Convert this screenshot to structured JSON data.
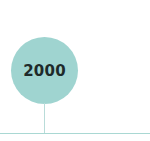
{
  "timeline": {
    "milestone": {
      "year": "2000"
    },
    "colors": {
      "circle_fill": "#9fd4d0",
      "year_text": "#1e2a2a",
      "connector": "#b9dcd9",
      "axis": "#a9d8d3"
    }
  }
}
